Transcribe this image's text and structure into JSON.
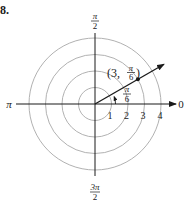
{
  "problem": {
    "number_label": "8."
  },
  "diagram": {
    "type": "polar-plot",
    "center": {
      "x": 95,
      "y": 104
    },
    "unit_px": 16.5,
    "circles": [
      1,
      2,
      3,
      4
    ],
    "circle_color": "#a8a8a8",
    "axis_color": "#1a1a1a",
    "angle_labels": {
      "right": "0",
      "left": "π",
      "top": {
        "num": "π",
        "den": "2"
      },
      "bottom": {
        "num": "3π",
        "den": "2"
      }
    },
    "radial_ticks": [
      "1",
      "2",
      "3",
      "4"
    ],
    "ray": {
      "angle_label": {
        "num": "π",
        "den": "6"
      }
    },
    "point": {
      "r": "3",
      "theta": {
        "num": "π",
        "den": "6"
      },
      "label_open": "(3, ",
      "label_close": ")"
    }
  }
}
